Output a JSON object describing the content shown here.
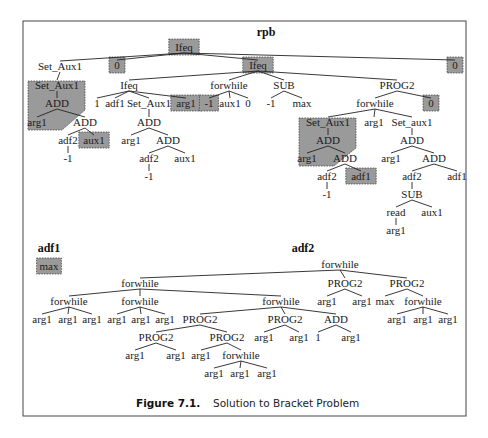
{
  "figure": {
    "caption_label": "Figure 7.1.",
    "caption_text": "Solution to Bracket Problem",
    "frame": {
      "x": 23,
      "y": 21,
      "w": 443,
      "h": 395
    },
    "shade_color": "#9a9a9a"
  },
  "trees": [
    {
      "name": "rpb",
      "title": "rpb",
      "title_pos": [
        266,
        36
      ],
      "nodes": [
        {
          "id": "r0",
          "label": "Ifeq",
          "x": 184,
          "y": 51,
          "shaded": true
        },
        {
          "id": "r1",
          "label": "Set_Aux1",
          "x": 60,
          "y": 70,
          "parent": "r0"
        },
        {
          "id": "r2",
          "label": "0",
          "x": 117,
          "y": 69,
          "parent": "r0",
          "shaded": true
        },
        {
          "id": "r3",
          "label": "Ifeq",
          "x": 258,
          "y": 69,
          "parent": "r0",
          "shaded": true
        },
        {
          "id": "r4",
          "label": "0",
          "x": 455,
          "y": 69,
          "parent": "r0",
          "shaded": true
        },
        {
          "id": "r5",
          "label": "Set_Aux1",
          "x": 57,
          "y": 89,
          "parent": "r1"
        },
        {
          "id": "r6",
          "label": "ADD",
          "x": 57,
          "y": 107,
          "parent": "r5"
        },
        {
          "id": "r7",
          "label": "arg1",
          "x": 37,
          "y": 126,
          "parent": "r6"
        },
        {
          "id": "r8",
          "label": "ADD",
          "x": 85,
          "y": 126,
          "parent": "r6"
        },
        {
          "id": "r9",
          "label": "adf2",
          "x": 68,
          "y": 144,
          "parent": "r8"
        },
        {
          "id": "r10",
          "label": "-1",
          "x": 68,
          "y": 162,
          "parent": "r9"
        },
        {
          "id": "r11",
          "label": "aux1",
          "x": 94,
          "y": 144,
          "parent": "r8",
          "shaded": true
        },
        {
          "id": "r12",
          "label": "Ifeq",
          "x": 129,
          "y": 89,
          "parent": "r3"
        },
        {
          "id": "r13",
          "label": "1",
          "x": 97,
          "y": 107,
          "parent": "r12"
        },
        {
          "id": "r14",
          "label": "adf1",
          "x": 115,
          "y": 107,
          "parent": "r12"
        },
        {
          "id": "r15",
          "label": "Set_Aux1",
          "x": 149,
          "y": 107,
          "parent": "r12"
        },
        {
          "id": "r16",
          "label": "arg1",
          "x": 186,
          "y": 107,
          "parent": "r12",
          "shaded": true
        },
        {
          "id": "r17",
          "label": "ADD",
          "x": 149,
          "y": 126,
          "parent": "r15"
        },
        {
          "id": "r18",
          "label": "arg1",
          "x": 131,
          "y": 144,
          "parent": "r17"
        },
        {
          "id": "r19",
          "label": "ADD",
          "x": 168,
          "y": 144,
          "parent": "r17"
        },
        {
          "id": "r20",
          "label": "adf2",
          "x": 149,
          "y": 162,
          "parent": "r19"
        },
        {
          "id": "r21",
          "label": "-1",
          "x": 149,
          "y": 180,
          "parent": "r20"
        },
        {
          "id": "r22",
          "label": "aux1",
          "x": 185,
          "y": 162,
          "parent": "r19"
        },
        {
          "id": "r23",
          "label": "forwhile",
          "x": 229,
          "y": 89,
          "parent": "r3"
        },
        {
          "id": "r24",
          "label": "-1",
          "x": 209,
          "y": 107,
          "parent": "r23",
          "shaded": true
        },
        {
          "id": "r25",
          "label": "aux1",
          "x": 230,
          "y": 107,
          "parent": "r23"
        },
        {
          "id": "r26",
          "label": "0",
          "x": 248,
          "y": 107,
          "parent": "r23"
        },
        {
          "id": "r27",
          "label": "SUB",
          "x": 284,
          "y": 89,
          "parent": "r3"
        },
        {
          "id": "r28",
          "label": "-1",
          "x": 271,
          "y": 107,
          "parent": "r27"
        },
        {
          "id": "r29",
          "label": "max",
          "x": 302,
          "y": 107,
          "parent": "r27"
        },
        {
          "id": "r30",
          "label": "PROG2",
          "x": 397,
          "y": 89,
          "parent": "r3"
        },
        {
          "id": "r31",
          "label": "forwhile",
          "x": 375,
          "y": 107,
          "parent": "r30"
        },
        {
          "id": "r32",
          "label": "0",
          "x": 431,
          "y": 107,
          "parent": "r30",
          "shaded": true
        },
        {
          "id": "r33",
          "label": "Set_Aux1",
          "x": 328,
          "y": 126,
          "parent": "r31"
        },
        {
          "id": "r34",
          "label": "arg1",
          "x": 374,
          "y": 126,
          "parent": "r31"
        },
        {
          "id": "r35",
          "label": "Set_aux1",
          "x": 412,
          "y": 126,
          "parent": "r31"
        },
        {
          "id": "r36",
          "label": "ADD",
          "x": 328,
          "y": 144,
          "parent": "r33"
        },
        {
          "id": "r37",
          "label": "arg1",
          "x": 307,
          "y": 162,
          "parent": "r36"
        },
        {
          "id": "r38",
          "label": "ADD",
          "x": 345,
          "y": 162,
          "parent": "r36"
        },
        {
          "id": "r39",
          "label": "adf2",
          "x": 327,
          "y": 180,
          "parent": "r38"
        },
        {
          "id": "r40",
          "label": "-1",
          "x": 327,
          "y": 198,
          "parent": "r39"
        },
        {
          "id": "r41",
          "label": "adf1",
          "x": 361,
          "y": 180,
          "parent": "r38",
          "shaded": true
        },
        {
          "id": "r42",
          "label": "ADD",
          "x": 412,
          "y": 144,
          "parent": "r35"
        },
        {
          "id": "r43",
          "label": "arg1",
          "x": 391,
          "y": 162,
          "parent": "r42"
        },
        {
          "id": "r44",
          "label": "ADD",
          "x": 434,
          "y": 162,
          "parent": "r42"
        },
        {
          "id": "r45",
          "label": "adf2",
          "x": 412,
          "y": 180,
          "parent": "r44"
        },
        {
          "id": "r46",
          "label": "adf1",
          "x": 457,
          "y": 180,
          "parent": "r44"
        },
        {
          "id": "r47",
          "label": "SUB",
          "x": 412,
          "y": 198,
          "parent": "r45"
        },
        {
          "id": "r48",
          "label": "read",
          "x": 396,
          "y": 216,
          "parent": "r47"
        },
        {
          "id": "r49",
          "label": "aux1",
          "x": 432,
          "y": 216,
          "parent": "r47"
        },
        {
          "id": "r50",
          "label": "arg1",
          "x": 396,
          "y": 234,
          "parent": "r48"
        }
      ],
      "shaded_regions": [
        {
          "name": "shaded-subtree-left",
          "points": "28,81 85,81 85,110 62,130 28,130"
        },
        {
          "name": "shaded-subtree-right",
          "points": "299,118 356,118 356,148 334,166 299,166"
        }
      ]
    },
    {
      "name": "adf1",
      "title": "adf1",
      "title_pos": [
        49,
        252
      ],
      "nodes": [
        {
          "id": "a0",
          "label": "max",
          "x": 49,
          "y": 270,
          "shaded": true
        }
      ],
      "shaded_regions": []
    },
    {
      "name": "adf2",
      "title": "adf2",
      "title_pos": [
        303,
        252
      ],
      "nodes": [
        {
          "id": "b0",
          "label": "forwhile",
          "x": 340,
          "y": 268
        },
        {
          "id": "b1",
          "label": "forwhile",
          "x": 140,
          "y": 287,
          "parent": "b0"
        },
        {
          "id": "b2",
          "label": "PROG2",
          "x": 345,
          "y": 287,
          "parent": "b0"
        },
        {
          "id": "b3",
          "label": "PROG2",
          "x": 407,
          "y": 287,
          "parent": "b0"
        },
        {
          "id": "b4",
          "label": "forwhile",
          "x": 69,
          "y": 305,
          "parent": "b1"
        },
        {
          "id": "b5",
          "label": "forwhile",
          "x": 140,
          "y": 305,
          "parent": "b1"
        },
        {
          "id": "b6",
          "label": "forwhile",
          "x": 281,
          "y": 305,
          "parent": "b1"
        },
        {
          "id": "b7",
          "label": "arg1",
          "x": 42,
          "y": 323,
          "parent": "b4"
        },
        {
          "id": "b8",
          "label": "arg1",
          "x": 68,
          "y": 323,
          "parent": "b4"
        },
        {
          "id": "b9",
          "label": "arg1",
          "x": 92,
          "y": 323,
          "parent": "b4"
        },
        {
          "id": "b10",
          "label": "arg1",
          "x": 117,
          "y": 323,
          "parent": "b5"
        },
        {
          "id": "b11",
          "label": "arg1",
          "x": 141,
          "y": 323,
          "parent": "b5"
        },
        {
          "id": "b12",
          "label": "arg1",
          "x": 165,
          "y": 323,
          "parent": "b5"
        },
        {
          "id": "b13",
          "label": "PROG2",
          "x": 200,
          "y": 323,
          "parent": "b6"
        },
        {
          "id": "b14",
          "label": "PROG2",
          "x": 285,
          "y": 323,
          "parent": "b6"
        },
        {
          "id": "b15",
          "label": "ADD",
          "x": 336,
          "y": 323,
          "parent": "b6"
        },
        {
          "id": "b16",
          "label": "PROG2",
          "x": 156,
          "y": 341,
          "parent": "b13"
        },
        {
          "id": "b17",
          "label": "PROG2",
          "x": 227,
          "y": 341,
          "parent": "b13"
        },
        {
          "id": "b18",
          "label": "arg1",
          "x": 135,
          "y": 359,
          "parent": "b16"
        },
        {
          "id": "b19",
          "label": "arg1",
          "x": 176,
          "y": 359,
          "parent": "b16"
        },
        {
          "id": "b20",
          "label": "arg1",
          "x": 201,
          "y": 359,
          "parent": "b17"
        },
        {
          "id": "b21",
          "label": "forwhile",
          "x": 241,
          "y": 359,
          "parent": "b17"
        },
        {
          "id": "b22",
          "label": "arg1",
          "x": 214,
          "y": 377,
          "parent": "b21"
        },
        {
          "id": "b23",
          "label": "arg1",
          "x": 240,
          "y": 377,
          "parent": "b21"
        },
        {
          "id": "b24",
          "label": "arg1",
          "x": 267,
          "y": 377,
          "parent": "b21"
        },
        {
          "id": "b25",
          "label": "arg1",
          "x": 264,
          "y": 341,
          "parent": "b14"
        },
        {
          "id": "b26",
          "label": "arg1",
          "x": 299,
          "y": 341,
          "parent": "b14"
        },
        {
          "id": "b27",
          "label": "1",
          "x": 318,
          "y": 341,
          "parent": "b15"
        },
        {
          "id": "b28",
          "label": "arg1",
          "x": 351,
          "y": 341,
          "parent": "b15"
        },
        {
          "id": "b29",
          "label": "arg1",
          "x": 327,
          "y": 305,
          "parent": "b2"
        },
        {
          "id": "b30",
          "label": "arg1",
          "x": 362,
          "y": 305,
          "parent": "b2"
        },
        {
          "id": "b31",
          "label": "max",
          "x": 385,
          "y": 305,
          "parent": "b3"
        },
        {
          "id": "b32",
          "label": "forwhile",
          "x": 423,
          "y": 305,
          "parent": "b3"
        },
        {
          "id": "b33",
          "label": "arg1",
          "x": 397,
          "y": 323,
          "parent": "b32"
        },
        {
          "id": "b34",
          "label": "arg1",
          "x": 423,
          "y": 323,
          "parent": "b32"
        },
        {
          "id": "b35",
          "label": "arg1",
          "x": 448,
          "y": 323,
          "parent": "b32"
        }
      ],
      "shaded_regions": []
    }
  ]
}
